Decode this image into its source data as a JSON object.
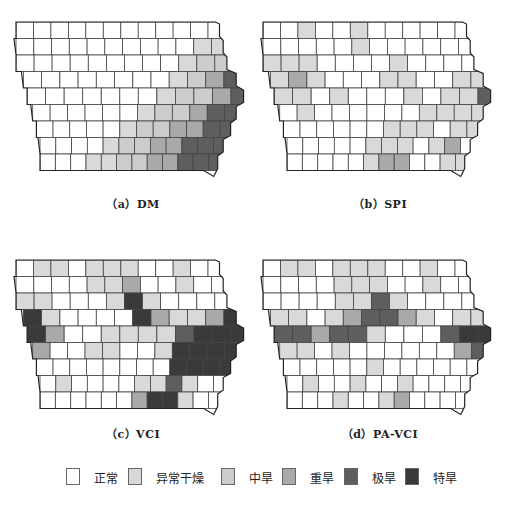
{
  "figure": {
    "panels": [
      {
        "id": "a",
        "caption": "（a）DM"
      },
      {
        "id": "b",
        "caption": "（b）SPI"
      },
      {
        "id": "c",
        "caption": "（c）VCI"
      },
      {
        "id": "d",
        "caption": "（d）PA-VCI"
      }
    ],
    "legend": [
      {
        "label": "正常",
        "color": "#ffffff"
      },
      {
        "label": "异常干燥",
        "color": "#d9d9d9"
      },
      {
        "label": "中旱",
        "color": "#cccccc"
      },
      {
        "label": "重旱",
        "color": "#a9a9a9"
      },
      {
        "label": "极旱",
        "color": "#5e5e5e"
      },
      {
        "label": "特旱",
        "color": "#3a3a3a"
      }
    ]
  },
  "chart_data": {
    "type": "choropleth",
    "region": "Iowa counties",
    "grid_rows": 9,
    "grid_cols": 12,
    "classes": [
      "正常",
      "异常干燥",
      "中旱",
      "重旱",
      "极旱",
      "特旱"
    ],
    "maps": [
      {
        "title": "（a）DM",
        "note": "diagonal drought gradient increasing to the east/southeast",
        "grid": [
          [
            0,
            0,
            0,
            0,
            0,
            0,
            0,
            0,
            0,
            0,
            0,
            0
          ],
          [
            0,
            0,
            0,
            0,
            0,
            0,
            0,
            0,
            0,
            0,
            1,
            1
          ],
          [
            0,
            0,
            0,
            0,
            0,
            0,
            0,
            0,
            0,
            1,
            2,
            2
          ],
          [
            0,
            0,
            0,
            0,
            0,
            0,
            0,
            0,
            1,
            2,
            3,
            4
          ],
          [
            0,
            0,
            0,
            0,
            0,
            0,
            0,
            1,
            2,
            2,
            3,
            4
          ],
          [
            0,
            0,
            0,
            0,
            0,
            0,
            1,
            2,
            2,
            3,
            4,
            4
          ],
          [
            0,
            0,
            0,
            0,
            0,
            1,
            2,
            2,
            3,
            3,
            4,
            4
          ],
          [
            0,
            0,
            0,
            0,
            1,
            2,
            2,
            3,
            3,
            4,
            4,
            4
          ],
          [
            0,
            0,
            0,
            1,
            1,
            2,
            2,
            3,
            3,
            4,
            4,
            4
          ]
        ]
      },
      {
        "title": "（b）SPI",
        "grid": [
          [
            0,
            0,
            1,
            0,
            0,
            1,
            0,
            0,
            0,
            0,
            0,
            0
          ],
          [
            0,
            0,
            0,
            0,
            0,
            1,
            0,
            0,
            0,
            0,
            0,
            0
          ],
          [
            1,
            1,
            1,
            0,
            0,
            0,
            0,
            1,
            0,
            0,
            0,
            0
          ],
          [
            1,
            3,
            1,
            0,
            0,
            0,
            1,
            1,
            0,
            0,
            1,
            1
          ],
          [
            1,
            1,
            0,
            1,
            0,
            0,
            0,
            1,
            0,
            1,
            1,
            4
          ],
          [
            0,
            1,
            0,
            0,
            0,
            0,
            0,
            0,
            1,
            1,
            1,
            1
          ],
          [
            0,
            0,
            0,
            0,
            0,
            0,
            1,
            1,
            1,
            0,
            1,
            1
          ],
          [
            0,
            0,
            0,
            0,
            0,
            1,
            1,
            1,
            0,
            1,
            3,
            0
          ],
          [
            0,
            0,
            0,
            0,
            0,
            1,
            3,
            3,
            0,
            0,
            1,
            1
          ]
        ]
      },
      {
        "title": "（c）VCI",
        "grid": [
          [
            0,
            1,
            1,
            0,
            1,
            1,
            1,
            0,
            0,
            1,
            0,
            0
          ],
          [
            0,
            0,
            0,
            0,
            1,
            1,
            3,
            0,
            0,
            1,
            0,
            0
          ],
          [
            1,
            1,
            0,
            0,
            0,
            1,
            5,
            1,
            0,
            0,
            0,
            0
          ],
          [
            5,
            1,
            0,
            0,
            0,
            0,
            5,
            3,
            1,
            1,
            3,
            5
          ],
          [
            5,
            3,
            0,
            0,
            1,
            1,
            1,
            1,
            4,
            5,
            5,
            5
          ],
          [
            3,
            0,
            0,
            1,
            1,
            0,
            0,
            1,
            5,
            5,
            5,
            5
          ],
          [
            0,
            0,
            0,
            0,
            0,
            0,
            0,
            0,
            5,
            5,
            5,
            5
          ],
          [
            0,
            1,
            0,
            0,
            0,
            0,
            1,
            1,
            4,
            1,
            0,
            0
          ],
          [
            0,
            0,
            0,
            0,
            0,
            0,
            3,
            5,
            5,
            1,
            0,
            0
          ]
        ]
      },
      {
        "title": "（d）PA-VCI",
        "grid": [
          [
            0,
            1,
            1,
            0,
            1,
            1,
            1,
            0,
            0,
            1,
            0,
            0
          ],
          [
            0,
            0,
            0,
            0,
            1,
            1,
            1,
            0,
            0,
            1,
            0,
            0
          ],
          [
            0,
            0,
            0,
            0,
            1,
            1,
            4,
            1,
            0,
            0,
            0,
            0
          ],
          [
            1,
            1,
            0,
            1,
            3,
            4,
            4,
            3,
            1,
            0,
            1,
            1
          ],
          [
            4,
            4,
            3,
            4,
            4,
            1,
            0,
            0,
            0,
            4,
            5,
            5
          ],
          [
            1,
            1,
            0,
            1,
            0,
            0,
            0,
            0,
            0,
            0,
            3,
            4
          ],
          [
            0,
            0,
            0,
            0,
            0,
            1,
            0,
            0,
            0,
            0,
            0,
            0
          ],
          [
            0,
            1,
            0,
            0,
            1,
            0,
            0,
            1,
            0,
            0,
            0,
            0
          ],
          [
            0,
            0,
            0,
            1,
            0,
            0,
            1,
            3,
            0,
            0,
            0,
            0
          ]
        ]
      }
    ]
  }
}
